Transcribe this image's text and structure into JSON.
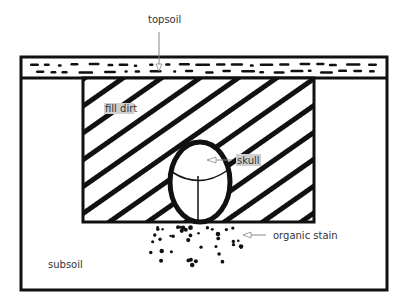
{
  "diagram": {
    "type": "burial cross-section",
    "labels": {
      "topsoil": "topsoil",
      "fill_dirt": "fill dirt",
      "skull": "skull",
      "organic_stain": "organic stain",
      "subsoil": "subsoil"
    },
    "colors": {
      "ink": "#111111",
      "label_text": "#333333",
      "label_bg": "#cfcfcf",
      "arrow": "#888888"
    }
  }
}
